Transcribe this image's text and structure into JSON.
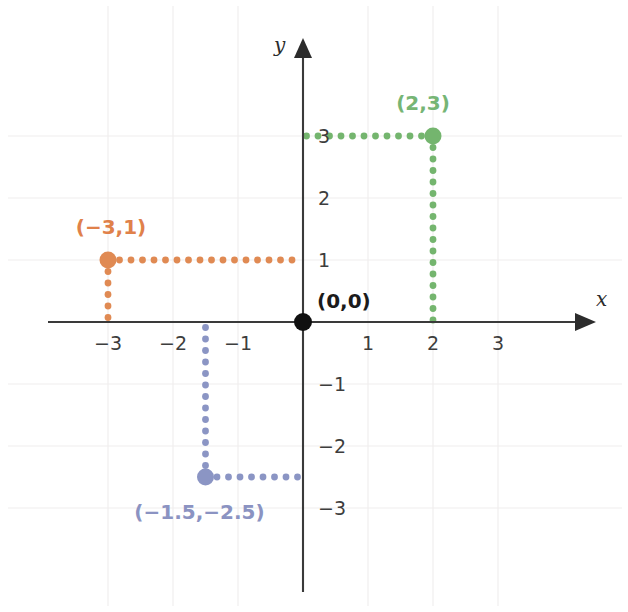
{
  "chart_data": {
    "type": "scatter",
    "title": "",
    "subtitle": "",
    "xlabel": "x",
    "ylabel": "y",
    "xlim": [
      -3.9,
      4.4
    ],
    "ylim": [
      -4.5,
      4.5
    ],
    "grid": true,
    "legend": false,
    "legend_position": "none",
    "x_ticks": [
      -3,
      -2,
      -1,
      1,
      2,
      3
    ],
    "x_tick_labels": [
      "−3",
      "−2",
      "−1",
      "1",
      "2",
      "3"
    ],
    "y_ticks": [
      3,
      2,
      1,
      -1,
      -2,
      -3
    ],
    "y_tick_labels": [
      "3",
      "2",
      "1",
      "−1",
      "−2",
      "−3"
    ],
    "points": [
      {
        "name": "origin",
        "label": "(0,0)",
        "x": 0,
        "y": 0,
        "color": "#101010",
        "label_color": "#1b1b1b",
        "dotted_guides": false,
        "marker_radius": 9
      },
      {
        "name": "green-point",
        "label": "(2,3)",
        "x": 2,
        "y": 3,
        "color": "#74b56e",
        "label_color": "#76b575",
        "dotted_guides": true,
        "marker_radius": 8.5
      },
      {
        "name": "orange-point",
        "label": "(−3,1)",
        "x": -3,
        "y": 1,
        "color": "#e08a53",
        "label_color": "#e0814a",
        "dotted_guides": true,
        "marker_radius": 8.5
      },
      {
        "name": "blue-point",
        "label": "(−1.5,−2.5)",
        "x": -1.5,
        "y": -2.5,
        "color": "#8b95c4",
        "label_color": "#8b93c2",
        "dotted_guides": true,
        "marker_radius": 8.5
      }
    ],
    "colors": {
      "green": "#74b56e",
      "orange": "#e08a53",
      "blue": "#8b95c4",
      "axis": "#3a3a3a",
      "grid": "#f0eeee",
      "background": "#ffffff",
      "origin": "#101010"
    }
  },
  "axes": {
    "x_axis_name": "x",
    "y_axis_name": "y"
  }
}
